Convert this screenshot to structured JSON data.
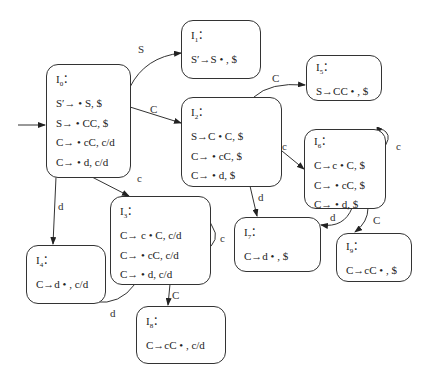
{
  "diagram": {
    "type": "LR(1) item-set automaton (DFA)",
    "states": [
      {
        "id": "I0",
        "title_main": "I",
        "title_sub": "0",
        "title_suffix": "：",
        "items": [
          "S′→ • S, $",
          "S→ • CC, $",
          "C→ • cC, c/d",
          "C→ • d, c/d"
        ]
      },
      {
        "id": "I1",
        "title_main": "I",
        "title_sub": "1",
        "title_suffix": "：",
        "items": [
          "S′→S • , $"
        ]
      },
      {
        "id": "I2",
        "title_main": "I",
        "title_sub": "2",
        "title_suffix": "：",
        "items": [
          "S→C • C, $",
          "C→ • cC, $",
          "C→ • d, $"
        ]
      },
      {
        "id": "I3",
        "title_main": "I",
        "title_sub": "3",
        "title_suffix": "：",
        "items": [
          "C→ c • C, c/d",
          "C→ • cC, c/d",
          "C→ • d, c/d"
        ]
      },
      {
        "id": "I4",
        "title_main": "I",
        "title_sub": "4",
        "title_suffix": "：",
        "items": [
          "C→d • , c/d"
        ]
      },
      {
        "id": "I5",
        "title_main": "I",
        "title_sub": "5",
        "title_suffix": "：",
        "items": [
          "S→CC • , $"
        ]
      },
      {
        "id": "I6",
        "title_main": "I",
        "title_sub": "6",
        "title_suffix": "：",
        "items": [
          "C→c • C, $",
          "C→ • cC, $",
          "C→ • d, $"
        ]
      },
      {
        "id": "I7",
        "title_main": "I",
        "title_sub": "7",
        "title_suffix": "：",
        "items": [
          "C→d • , $"
        ]
      },
      {
        "id": "I8",
        "title_main": "I",
        "title_sub": "8",
        "title_suffix": "：",
        "items": [
          "C→cC • , c/d"
        ]
      },
      {
        "id": "I9",
        "title_main": "I",
        "title_sub": "9",
        "title_suffix": "：",
        "items": [
          "C→cC • , $"
        ]
      }
    ],
    "edges": [
      {
        "from": "start",
        "to": "I0",
        "label": ""
      },
      {
        "from": "I0",
        "to": "I1",
        "label": "S"
      },
      {
        "from": "I0",
        "to": "I2",
        "label": "C"
      },
      {
        "from": "I0",
        "to": "I3",
        "label": "c"
      },
      {
        "from": "I0",
        "to": "I4",
        "label": "d"
      },
      {
        "from": "I2",
        "to": "I5",
        "label": "C"
      },
      {
        "from": "I2",
        "to": "I6",
        "label": "c"
      },
      {
        "from": "I2",
        "to": "I7",
        "label": "d"
      },
      {
        "from": "I3",
        "to": "I3",
        "label": "c"
      },
      {
        "from": "I3",
        "to": "I8",
        "label": "C"
      },
      {
        "from": "I3",
        "to": "I4",
        "label": "d"
      },
      {
        "from": "I6",
        "to": "I6",
        "label": "c"
      },
      {
        "from": "I6",
        "to": "I7",
        "label": "d"
      },
      {
        "from": "I6",
        "to": "I9",
        "label": "C"
      }
    ]
  }
}
